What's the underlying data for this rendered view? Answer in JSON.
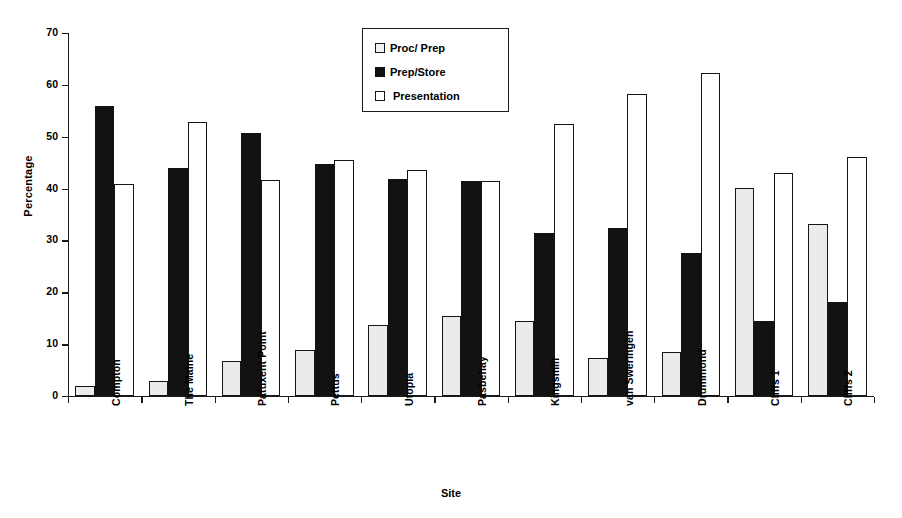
{
  "chart_data": {
    "type": "bar",
    "title": "",
    "xlabel": "Site",
    "ylabel": "Percentage",
    "ylim": [
      0,
      70
    ],
    "yticks": [
      0,
      10,
      20,
      30,
      40,
      50,
      60,
      70
    ],
    "grid": false,
    "legend_position": "top-center",
    "categories": [
      "Compton",
      "The Maine",
      "Patuxent Point",
      "Pettus",
      "Utopia",
      "Pasbehay",
      "Kingsmill",
      "van Sweringen",
      "Drummond",
      "Cliffs 1",
      "Cliffs 2"
    ],
    "series": [
      {
        "name": "Proc/ Prep",
        "swatch": "s0",
        "color": "#ebebeb",
        "values": [
          1.9,
          2.8,
          6.8,
          8.9,
          13.7,
          15.5,
          14.5,
          7.4,
          8.4,
          40.2,
          33.1
        ]
      },
      {
        "name": "Prep/Store",
        "swatch": "s1",
        "color": "#121212",
        "values": [
          55.9,
          43.9,
          50.8,
          44.7,
          41.8,
          41.4,
          31.4,
          32.4,
          27.5,
          14.4,
          18.2
        ]
      },
      {
        "name": "Presentation",
        "swatch": "s2",
        "color": "#ffffff",
        "values": [
          40.8,
          52.8,
          41.6,
          45.6,
          43.5,
          41.5,
          52.4,
          58.3,
          62.2,
          43.1,
          46.1
        ]
      }
    ]
  }
}
